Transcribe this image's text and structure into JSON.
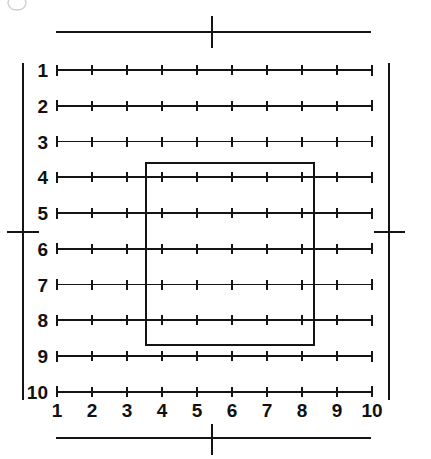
{
  "figure": {
    "title": ""
  },
  "chart_data": {
    "type": "scatter",
    "title": "",
    "xlabel": "",
    "ylabel": "",
    "grid": true,
    "legend": null,
    "xlim": [
      1,
      10
    ],
    "ylim": [
      1,
      10
    ],
    "x_tick_labels": [
      "1",
      "2",
      "3",
      "4",
      "5",
      "6",
      "7",
      "8",
      "9",
      "10"
    ],
    "y_tick_labels": [
      "1",
      "2",
      "3",
      "4",
      "5",
      "6",
      "7",
      "8",
      "9",
      "10"
    ],
    "x_ticks": [
      1,
      2,
      3,
      4,
      5,
      6,
      7,
      8,
      9,
      10
    ],
    "y_ticks": [
      1,
      2,
      3,
      4,
      5,
      6,
      7,
      8,
      9,
      10
    ],
    "rows": 10,
    "columns": 10,
    "ticks_per_row": 10,
    "annotations": [
      {
        "name": "inner-region",
        "shape": "rectangle",
        "x_start": 3.55,
        "x_end": 8.35,
        "y_start": 3.6,
        "y_end": 8.7
      }
    ]
  },
  "grid": {
    "row_labels": [
      "1",
      "2",
      "3",
      "4",
      "5",
      "6",
      "7",
      "8",
      "9",
      "10"
    ],
    "column_labels": [
      "1",
      "2",
      "3",
      "4",
      "5",
      "6",
      "7",
      "8",
      "9",
      "10"
    ]
  },
  "frame": {
    "top_mark": "center-registration-tick",
    "bottom_mark": "center-registration-tick",
    "left_mark": "center-registration-tick",
    "right_mark": "center-registration-tick"
  },
  "colors": {
    "ink": "#141414",
    "background": "#ffffff",
    "smudge": "#cfcfcf"
  }
}
